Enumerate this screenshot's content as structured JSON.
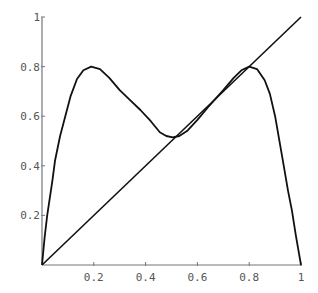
{
  "chart_data": {
    "type": "line",
    "title": "",
    "xlabel": "",
    "ylabel": "",
    "xlim": [
      0,
      1
    ],
    "ylim": [
      0,
      1
    ],
    "grid": false,
    "legend": null,
    "x_ticks": [
      0.2,
      0.4,
      0.6,
      0.8,
      1
    ],
    "x_tick_labels": [
      "0.2",
      "0.4",
      "0.6",
      "0.8",
      "1"
    ],
    "y_ticks": [
      0.2,
      0.4,
      0.6,
      0.8,
      1
    ],
    "y_tick_labels": [
      "0.2",
      "0.4",
      "0.6",
      "0.8",
      "1"
    ],
    "series": [
      {
        "name": "f(x)",
        "x": [
          0,
          0.01,
          0.02,
          0.04,
          0.05,
          0.07,
          0.09,
          0.11,
          0.135,
          0.16,
          0.19,
          0.224,
          0.26,
          0.3,
          0.34,
          0.38,
          0.42,
          0.455,
          0.48,
          0.505,
          0.53,
          0.56,
          0.6,
          0.64,
          0.668,
          0.7,
          0.74,
          0.77,
          0.8,
          0.83,
          0.86,
          0.88,
          0.9,
          0.93,
          0.95,
          0.965,
          0.98,
          0.99,
          1.0
        ],
        "y": [
          0,
          0.11,
          0.2,
          0.34,
          0.42,
          0.52,
          0.6,
          0.68,
          0.75,
          0.785,
          0.8,
          0.79,
          0.755,
          0.705,
          0.665,
          0.625,
          0.58,
          0.535,
          0.52,
          0.515,
          0.52,
          0.54,
          0.585,
          0.635,
          0.668,
          0.705,
          0.755,
          0.785,
          0.8,
          0.79,
          0.745,
          0.69,
          0.6,
          0.42,
          0.3,
          0.22,
          0.12,
          0.06,
          0
        ]
      },
      {
        "name": "y = x",
        "x": [
          0,
          1
        ],
        "y": [
          0,
          1
        ]
      }
    ]
  }
}
